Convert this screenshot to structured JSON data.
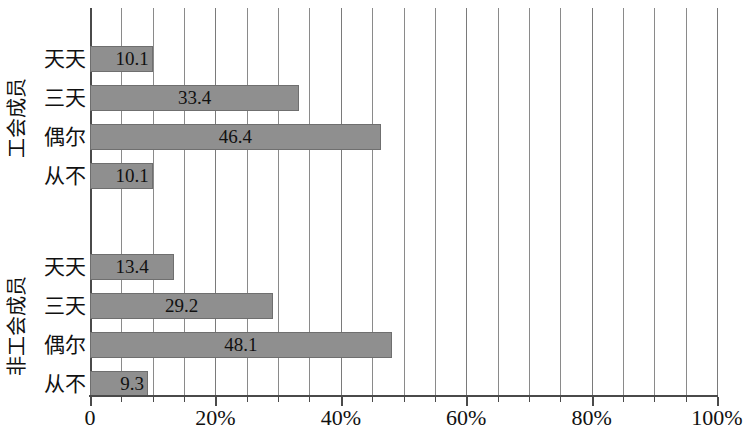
{
  "chart_data": {
    "type": "bar",
    "orientation": "horizontal",
    "title": "",
    "subtitle": "",
    "xlabel": "",
    "ylabel": "",
    "xlim": [
      0,
      100
    ],
    "grid": true,
    "grid_interval": 5,
    "legend": "none",
    "x_tick_labels": [
      "0",
      "20%",
      "40%",
      "60%",
      "80%",
      "100%"
    ],
    "x_tick_values": [
      0,
      20,
      40,
      60,
      80,
      100
    ],
    "groups": [
      {
        "name": "工会成员",
        "categories": [
          "天天",
          "三天",
          "偶尔",
          "从不"
        ],
        "values": [
          10.1,
          33.4,
          46.4,
          10.1
        ],
        "value_labels": [
          "10.1",
          "33.4",
          "46.4",
          "10.1"
        ]
      },
      {
        "name": "非工会成员",
        "categories": [
          "天天",
          "三天",
          "偶尔",
          "从不"
        ],
        "values": [
          13.4,
          29.2,
          48.1,
          9.3
        ],
        "value_labels": [
          "13.4",
          "29.2",
          "48.1",
          "9.3"
        ]
      }
    ],
    "colors": {
      "bar_fill": "#8f8f8f",
      "bar_stroke": "#6f6f6f",
      "gridline": "#8a8a8a",
      "axis": "#4a4a4a",
      "text": "#111111",
      "background": "#ffffff"
    }
  }
}
